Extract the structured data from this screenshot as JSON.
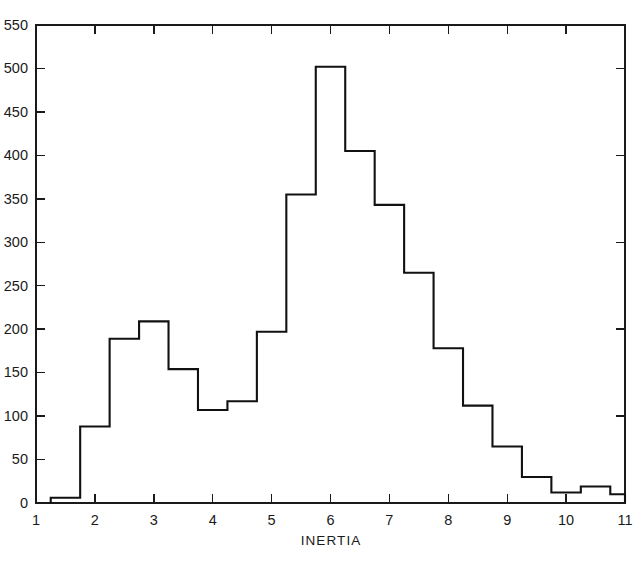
{
  "chart_data": {
    "type": "bar",
    "title": "",
    "subtitle": "",
    "xlabel": "INERTIA",
    "ylabel": "",
    "xlim": [
      1,
      11
    ],
    "ylim": [
      0,
      550
    ],
    "grid": false,
    "legend": null,
    "style": {
      "line_color": "#111111",
      "axis_color": "#1a1a1a",
      "background": "#ffffff",
      "line_width": 2.1
    },
    "bin_width": 0.5,
    "x_ticks": [
      1,
      2,
      3,
      4,
      5,
      6,
      7,
      8,
      9,
      10,
      11
    ],
    "x_tick_labels": [
      "1",
      "2",
      "3",
      "4",
      "5",
      "6",
      "7",
      "8",
      "9",
      "10",
      "11"
    ],
    "y_ticks": [
      0,
      50,
      100,
      150,
      200,
      250,
      300,
      350,
      400,
      450,
      500,
      550
    ],
    "y_tick_labels": [
      "0",
      "50",
      "100",
      "150",
      "200",
      "250",
      "300",
      "350",
      "400",
      "450",
      "500",
      "550"
    ],
    "bin_edges": [
      1.25,
      1.75,
      2.25,
      2.75,
      3.25,
      3.75,
      4.25,
      4.75,
      5.25,
      5.75,
      6.25,
      6.75,
      7.25,
      7.75,
      8.25,
      8.75,
      9.25,
      9.75,
      10.25,
      10.75,
      11.0
    ],
    "bin_centers": [
      1.5,
      2.0,
      2.5,
      3.0,
      3.5,
      4.0,
      4.5,
      5.0,
      5.5,
      6.0,
      6.5,
      7.0,
      7.5,
      8.0,
      8.5,
      9.0,
      9.5,
      10.0,
      10.5,
      10.875
    ],
    "values": [
      6,
      88,
      189,
      209,
      154,
      107,
      117,
      197,
      355,
      502,
      405,
      343,
      265,
      178,
      112,
      65,
      30,
      12,
      19,
      10
    ],
    "categories": [
      "1.25-1.75",
      "1.75-2.25",
      "2.25-2.75",
      "2.75-3.25",
      "3.25-3.75",
      "3.75-4.25",
      "4.25-4.75",
      "4.75-5.25",
      "5.25-5.75",
      "5.75-6.25",
      "6.25-6.75",
      "6.75-7.25",
      "7.25-7.75",
      "7.75-8.25",
      "8.25-8.75",
      "8.75-9.25",
      "9.25-9.75",
      "9.75-10.25",
      "10.25-10.75",
      "10.75-11.0"
    ],
    "annotations": []
  },
  "figure": {
    "axis_title_text": "INERTIA"
  }
}
